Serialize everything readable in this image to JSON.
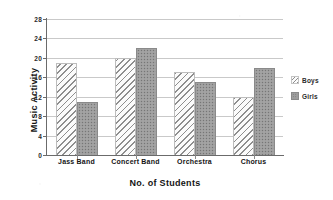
{
  "chart_data": {
    "type": "bar",
    "title": "",
    "xlabel": "No. of Students",
    "ylabel": "Music Activity",
    "categories": [
      "Jass Band",
      "Concert Band",
      "Orchestra",
      "Chorus"
    ],
    "series": [
      {
        "name": "Boys",
        "values": [
          19,
          20,
          17,
          12
        ]
      },
      {
        "name": "Girls",
        "values": [
          11,
          22,
          15,
          18
        ]
      }
    ],
    "ylim": [
      0,
      28
    ],
    "yticks": [
      0,
      4,
      8,
      12,
      16,
      20,
      24,
      28
    ],
    "ytick_labels": [
      "0",
      "4",
      "8",
      "12",
      "16",
      "20",
      "24",
      "28"
    ],
    "grid": true,
    "grid_axis": "y",
    "legend_position": "right",
    "legend": [
      {
        "label": "Boys",
        "pattern": "diagonal-hatch",
        "color": "#f2f2f2"
      },
      {
        "label": "Girls",
        "pattern": "dotted-fill",
        "color": "#9d9d9d"
      }
    ],
    "colors": {
      "boys": "#f2f2f2",
      "girls": "#9d9d9d",
      "axis": "#6b6b6b",
      "gridline": "#c9c9c9",
      "text": "#141414",
      "background": "#ffffff"
    }
  }
}
